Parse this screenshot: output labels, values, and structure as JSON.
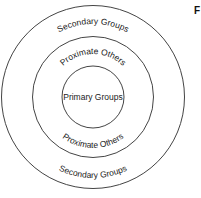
{
  "diagram": {
    "center": [
      93,
      97
    ],
    "stroke_color": "#444444",
    "rings": [
      {
        "name": "outer",
        "radius": 92,
        "label_top": "Secondary Groups",
        "label_bottom": "Secondary Groups"
      },
      {
        "name": "middle",
        "radius": 61,
        "label_top": "Proximate Others",
        "label_bottom": "Proximate Others"
      },
      {
        "name": "inner",
        "radius": 31,
        "label": "Primary Groups"
      }
    ],
    "corner_letter": "F"
  }
}
